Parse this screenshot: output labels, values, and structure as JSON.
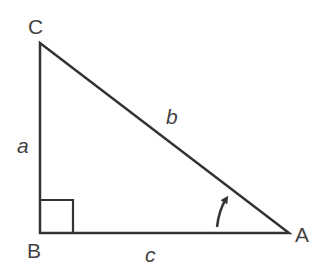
{
  "diagram": {
    "type": "right-triangle",
    "vertices": {
      "C": {
        "label": "C",
        "x": 40,
        "y": 43
      },
      "B": {
        "label": "B",
        "x": 40,
        "y": 233
      },
      "A": {
        "label": "A",
        "x": 289,
        "y": 233
      }
    },
    "sides": {
      "a": {
        "label": "a"
      },
      "b": {
        "label": "b"
      },
      "c": {
        "label": "c"
      }
    },
    "right_angle_at": "B",
    "angle_marker_at": "A",
    "stroke_color": "#333333",
    "label_color": "#444444"
  }
}
